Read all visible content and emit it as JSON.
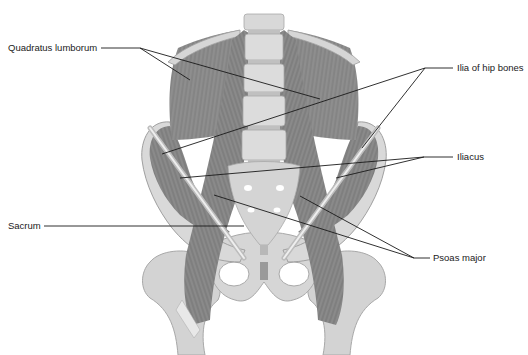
{
  "figure": {
    "colors": {
      "background": "#ffffff",
      "bone": "#d6d6d6",
      "bone_edge": "#a8a8a8",
      "bone_highlight": "#ececec",
      "muscle": "#8e8e8e",
      "muscle_dark": "#6e6e6e",
      "leader_line": "#1a1a1a",
      "label_text": "#1a1a1a"
    },
    "labels": [
      {
        "id": "quadratus-lumborum",
        "text": "Quadratus lumborum",
        "side": "left"
      },
      {
        "id": "ilia-of-hip-bones",
        "text": "Ilia of hip bones",
        "side": "right"
      },
      {
        "id": "iliacus",
        "text": "Iliacus",
        "side": "right"
      },
      {
        "id": "sacrum",
        "text": "Sacrum",
        "side": "left"
      },
      {
        "id": "psoas-major",
        "text": "Psoas major",
        "side": "right"
      }
    ]
  }
}
